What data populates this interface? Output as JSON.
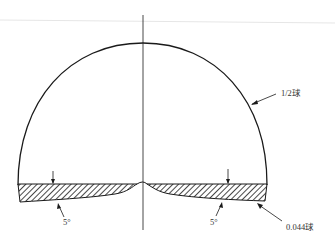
{
  "diagram": {
    "labels": {
      "half_sphere": "1/2球",
      "angle_left": "5°",
      "angle_right": "5°",
      "small_sphere": "0.044球"
    },
    "colors": {
      "line": "#1a1a1a",
      "text": "#333333",
      "background": "#ffffff",
      "faint_rule": "#e6e6e6"
    }
  }
}
